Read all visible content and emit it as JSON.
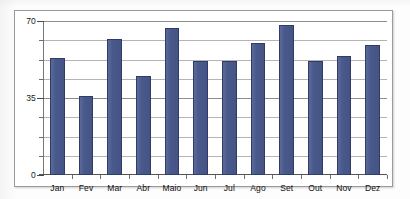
{
  "chart_data": {
    "type": "bar",
    "title": "",
    "subtitle": "",
    "xlabel": "",
    "ylabel": "",
    "categories": [
      "Jan",
      "Fev",
      "Mar",
      "Abr",
      "Maio",
      "Jun",
      "Jul",
      "Ago",
      "Set",
      "Out",
      "Nov",
      "Dez"
    ],
    "values": [
      53,
      36,
      62,
      45,
      67,
      52,
      52,
      60,
      68,
      52,
      54,
      59
    ],
    "series": [
      {
        "name": "",
        "values": [
          53,
          36,
          62,
          45,
          67,
          52,
          52,
          60,
          68,
          52,
          54,
          59
        ],
        "color": "#49598C"
      }
    ],
    "ylim": [
      0,
      70
    ],
    "y_ticks_labeled": [
      "0",
      "35",
      "70"
    ],
    "y_tick_values": [
      0,
      35,
      70
    ],
    "y_minor_step": 8.75,
    "grid": true,
    "grid_orientation": "horizontal",
    "legend": false,
    "legend_position": "none",
    "annotations": []
  },
  "axes": {
    "y_labels": [
      {
        "text": "70",
        "value": 70
      },
      {
        "text": "35",
        "value": 35
      },
      {
        "text": "0",
        "value": 0
      }
    ]
  },
  "style": {
    "bar_fill": "#49598C",
    "bar_stroke": "#2F3C68",
    "gridline_major": "#8E8E8E",
    "gridline_minor": "#B4B4B4",
    "axis_color": "#555555",
    "frame_border": "#9A9A9A",
    "plot_background": "#FFFFFF",
    "page_background": "#FDFDFD",
    "label_color": "#111111"
  }
}
